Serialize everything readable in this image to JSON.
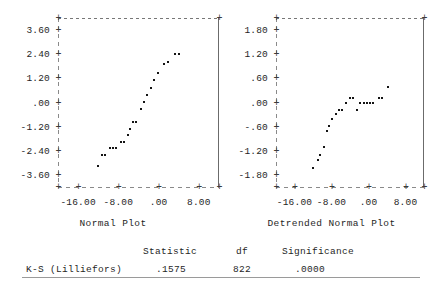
{
  "chart_data": [
    {
      "type": "scatter",
      "title": "Normal Plot",
      "xlabel": "Normal Plot",
      "ylabel": "",
      "xlim": [
        -20.0,
        12.0
      ],
      "ylim": [
        -4.2,
        4.2
      ],
      "xticks": [
        -16.0,
        -8.0,
        0.0,
        8.0
      ],
      "xticklabels": [
        "-16.00",
        "-8.00",
        ".00",
        "8.00"
      ],
      "yticks": [
        3.6,
        2.4,
        1.2,
        0.0,
        -1.2,
        -2.4,
        -3.6
      ],
      "yticklabels": [
        "3.60",
        "2.40",
        "1.20",
        ".00",
        "-1.20",
        "-2.40",
        "-3.60"
      ],
      "grid": false,
      "legend": "none",
      "points": [
        {
          "x": -12.1,
          "y": -3.18
        },
        {
          "x": -11.2,
          "y": -2.62
        },
        {
          "x": -10.6,
          "y": -2.62
        },
        {
          "x": -9.6,
          "y": -2.28
        },
        {
          "x": -9.0,
          "y": -2.28
        },
        {
          "x": -8.4,
          "y": -2.28
        },
        {
          "x": -7.5,
          "y": -1.95
        },
        {
          "x": -6.8,
          "y": -1.95
        },
        {
          "x": -6.1,
          "y": -1.6
        },
        {
          "x": -5.6,
          "y": -1.3
        },
        {
          "x": -5.0,
          "y": -0.95
        },
        {
          "x": -4.4,
          "y": -0.95
        },
        {
          "x": -3.6,
          "y": -0.32
        },
        {
          "x": -3.0,
          "y": 0.02
        },
        {
          "x": -2.3,
          "y": 0.38
        },
        {
          "x": -1.6,
          "y": 0.72
        },
        {
          "x": -0.9,
          "y": 1.12
        },
        {
          "x": -0.1,
          "y": 1.48
        },
        {
          "x": 1.0,
          "y": 1.92
        },
        {
          "x": 1.8,
          "y": 2.02
        },
        {
          "x": 3.3,
          "y": 2.4
        },
        {
          "x": 4.1,
          "y": 2.4
        }
      ]
    },
    {
      "type": "scatter",
      "title": "Detrended Normal Plot",
      "xlabel": "Detrended Normal Plot",
      "ylabel": "",
      "xlim": [
        -20.0,
        12.0
      ],
      "ylim": [
        -2.1,
        2.1
      ],
      "xticks": [
        -16.0,
        -8.0,
        0.0,
        8.0
      ],
      "xticklabels": [
        "-16.00",
        "-8.00",
        ".00",
        "8.00"
      ],
      "yticks": [
        1.8,
        1.2,
        0.6,
        0.0,
        -0.6,
        -1.2,
        -1.8
      ],
      "yticklabels": [
        "1.80",
        "1.20",
        ".60",
        ".00",
        "-.60",
        "-1.20",
        "-1.80"
      ],
      "grid": false,
      "legend": "none",
      "points": [
        {
          "x": -11.9,
          "y": -1.62
        },
        {
          "x": -11.0,
          "y": -1.42
        },
        {
          "x": -10.4,
          "y": -1.3
        },
        {
          "x": -9.7,
          "y": -1.1
        },
        {
          "x": -9.0,
          "y": -0.72
        },
        {
          "x": -8.5,
          "y": -0.58
        },
        {
          "x": -7.8,
          "y": -0.42
        },
        {
          "x": -7.1,
          "y": -0.28
        },
        {
          "x": -6.3,
          "y": -0.18
        },
        {
          "x": -5.7,
          "y": -0.18
        },
        {
          "x": -4.8,
          "y": 0.0
        },
        {
          "x": -4.0,
          "y": 0.12
        },
        {
          "x": -3.3,
          "y": 0.12
        },
        {
          "x": -2.5,
          "y": -0.18
        },
        {
          "x": -1.9,
          "y": 0.0
        },
        {
          "x": -0.9,
          "y": 0.0
        },
        {
          "x": -0.3,
          "y": 0.0
        },
        {
          "x": 0.3,
          "y": 0.0
        },
        {
          "x": 0.9,
          "y": 0.0
        },
        {
          "x": 2.2,
          "y": 0.1
        },
        {
          "x": 2.9,
          "y": 0.1
        },
        {
          "x": 4.3,
          "y": 0.38
        }
      ]
    }
  ],
  "stats_table": {
    "headers": {
      "row_label": "",
      "statistic": "Statistic",
      "df": "df",
      "significance": "Significance"
    },
    "rows": [
      {
        "label": "K-S (Lilliefors)",
        "statistic": ".1575",
        "df": "822",
        "significance": ".0000"
      }
    ]
  }
}
